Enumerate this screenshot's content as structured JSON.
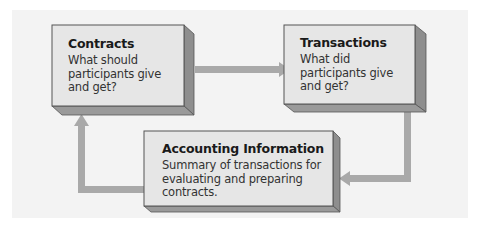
{
  "diagram": {
    "nodes": [
      {
        "id": "contracts",
        "title": "Contracts",
        "body": "What should participants give and get?"
      },
      {
        "id": "transactions",
        "title": "Transactions",
        "body": "What did participants give and get?"
      },
      {
        "id": "accounting",
        "title": "Accounting Information",
        "body": "Summary of transactions for evaluating and preparing contracts."
      }
    ],
    "edges": [
      {
        "from": "contracts",
        "to": "transactions"
      },
      {
        "from": "transactions",
        "to": "accounting"
      },
      {
        "from": "accounting",
        "to": "contracts"
      }
    ],
    "colors": {
      "panel": "#f3f3f3",
      "box_face": "#e6e6e6",
      "box_side": "#8e8e8e",
      "box_bottom": "#9a9a9a",
      "box_border": "#555555",
      "arrow": "#a9a9a9"
    }
  }
}
